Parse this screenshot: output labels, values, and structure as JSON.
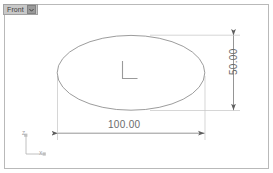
{
  "viewport": {
    "width": 273,
    "height": 173,
    "background_color": "#ffffff",
    "border_color": "#b9b9b9"
  },
  "view_label": {
    "name": "Front",
    "dropdown_icon": "chevron-down-icon",
    "background_color": "#c8c8c8",
    "text_color": "#3c3c3c"
  },
  "geometry": {
    "shape": "ellipse",
    "center": {
      "x": 131,
      "y": 72
    },
    "semi_axis_x": 74,
    "semi_axis_y": 37,
    "stroke_color": "#8a8a8a",
    "center_marker": "L"
  },
  "dimensions": [
    {
      "id": "horizontal",
      "label": "100.00",
      "value": 100.0,
      "orientation": "horizontal",
      "text_color": "#6b6b6b",
      "line_color": "#7a7a7a"
    },
    {
      "id": "vertical",
      "label": "50.00",
      "value": 50.0,
      "orientation": "vertical",
      "text_color": "#6b6b6b",
      "line_color": "#7a7a7a"
    }
  ],
  "axis_triad": {
    "vertical_axis_label": "Z",
    "horizontal_axis_label": "X",
    "color": "#9d9d9d"
  }
}
